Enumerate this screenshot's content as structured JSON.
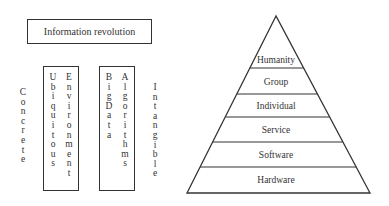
{
  "title": "Information revolution",
  "left_label": "Concrete",
  "right_label": "Intangible",
  "columns": [
    {
      "words": [
        "Ubiquitous",
        "Environment"
      ]
    },
    {
      "words": [
        "Big Data",
        "Algorithms"
      ]
    }
  ],
  "pyramid": {
    "layers_top_to_bottom": [
      "Humanity",
      "Group",
      "Individual",
      "Service",
      "Software",
      "Hardware"
    ]
  },
  "colors": {
    "stroke": "#333333",
    "background": "#ffffff"
  }
}
